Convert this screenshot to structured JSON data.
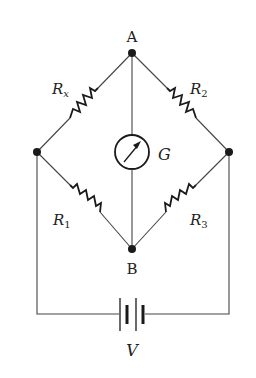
{
  "diagram": {
    "nodes": {
      "A": {
        "label": "A"
      },
      "B": {
        "label": "B"
      }
    },
    "components": {
      "rx": {
        "label": "R",
        "subscript": "x"
      },
      "r2": {
        "label": "R",
        "subscript": "2"
      },
      "r1": {
        "label": "R",
        "subscript": "1"
      },
      "r3": {
        "label": "R",
        "subscript": "3"
      },
      "galvanometer": {
        "label": "G"
      },
      "battery": {
        "label": "V"
      }
    },
    "colors": {
      "wire": "#444444",
      "component": "#1a1a1a",
      "background": "#ffffff"
    }
  }
}
